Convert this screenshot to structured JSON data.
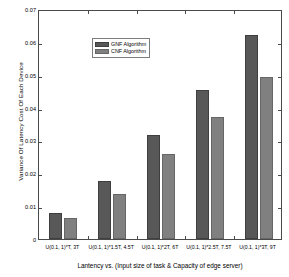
{
  "chart_data": {
    "type": "bar",
    "title": "",
    "xlabel": "Lantency vs. (Input size of task & Capacity of edge server)",
    "ylabel": "Variance Of Latency Cost Of Each Device",
    "categories": [
      "U(0.1, 1)*T, 3T",
      "U(0.1, 1)*1.5T, 4.5T",
      "U(0.1, 1)*2T, 6T",
      "U(0.1, 1)*2.5T, 7.5T",
      "U(0.1, 1)*3T, 9T"
    ],
    "series": [
      {
        "name": "GNF Algorithm",
        "color": "#585858",
        "values": [
          0.0078,
          0.0177,
          0.0318,
          0.0455,
          0.0622
        ]
      },
      {
        "name": "CNF Algorithm",
        "color": "#808080",
        "values": [
          0.0063,
          0.0138,
          0.0259,
          0.0372,
          0.0494
        ]
      }
    ],
    "ylim": [
      0,
      0.07
    ],
    "yticks": [
      0,
      0.01,
      0.02,
      0.03,
      0.04,
      0.05,
      0.06,
      0.07
    ],
    "ytick_labels": [
      "0",
      "0.01",
      "0.02",
      "0.03",
      "0.04",
      "0.05",
      "0.06",
      "0.07"
    ],
    "grid": false,
    "legend_position": "upper left",
    "legend_entries": [
      "GNF Algorithm",
      "CNF Algorithm"
    ]
  }
}
